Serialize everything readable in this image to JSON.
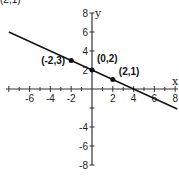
{
  "chart_data": {
    "type": "line",
    "title": "",
    "cut_off_top_label": "(2,1)",
    "xlabel": "x",
    "ylabel": "y",
    "xlim": [
      -8,
      8
    ],
    "ylim": [
      -8,
      8
    ],
    "x_ticks": [
      -8,
      -6,
      -4,
      -2,
      0,
      2,
      4,
      6,
      8
    ],
    "x_tick_labels": [
      "-6",
      "-4",
      "-2",
      "2",
      "4",
      "6",
      "8"
    ],
    "y_ticks": [
      -8,
      -6,
      -4,
      -2,
      0,
      2,
      4,
      6,
      8
    ],
    "y_tick_labels": [
      "8",
      "6",
      "4",
      "2",
      "-4",
      "-6",
      "-8"
    ],
    "grid": false,
    "series": [
      {
        "name": "y = -x/2 + 2",
        "equation": "y = -0.5x + 2",
        "x": [
          -8,
          8.2
        ],
        "y": [
          6,
          -2.1
        ]
      }
    ],
    "points": [
      {
        "label": "(-2,3)",
        "x": -2,
        "y": 3
      },
      {
        "label": "(0,2)",
        "x": 0,
        "y": 2
      },
      {
        "label": "(2,1)",
        "x": 2,
        "y": 1
      }
    ]
  }
}
